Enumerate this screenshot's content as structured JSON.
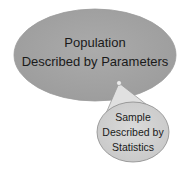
{
  "diagram": {
    "population": {
      "line1": "Population",
      "line2": "Described by Parameters",
      "fill": "#a6a6a6"
    },
    "sample": {
      "line1": "Sample",
      "line2": "Described by",
      "line3": "Statistics",
      "fill": "#d4d4d4"
    },
    "cone_fill": "#e2e2e2",
    "stroke": "#8a8a8a"
  }
}
